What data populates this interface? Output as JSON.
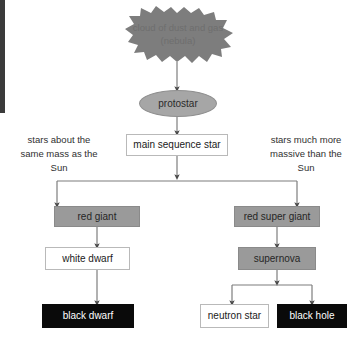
{
  "diagram": {
    "nodes": {
      "nebula": {
        "label": "cloud of dust and gas (nebula)",
        "shape": "cloud",
        "fill": "#7d7d7d"
      },
      "protostar": {
        "label": "protostar",
        "shape": "ellipse",
        "fill": "#a6a6a6"
      },
      "main_sequence": {
        "label": "main sequence star",
        "shape": "box",
        "fill": "#ffffff"
      },
      "red_giant": {
        "label": "red giant",
        "shape": "box",
        "fill": "#9a9a9a"
      },
      "red_super_giant": {
        "label": "red super giant",
        "shape": "box",
        "fill": "#9a9a9a"
      },
      "white_dwarf": {
        "label": "white dwarf",
        "shape": "box",
        "fill": "#ffffff"
      },
      "supernova": {
        "label": "supernova",
        "shape": "box",
        "fill": "#9a9a9a"
      },
      "black_dwarf": {
        "label": "black dwarf",
        "shape": "box",
        "fill": "#0a0a0a"
      },
      "neutron_star": {
        "label": "neutron star",
        "shape": "box",
        "fill": "#ffffff"
      },
      "black_hole": {
        "label": "black hole",
        "shape": "box",
        "fill": "#0a0a0a"
      }
    },
    "annotations": {
      "left_branch": "stars about the same mass as the Sun",
      "right_branch": "stars much more massive than the Sun"
    },
    "colors": {
      "arrow": "#6d6d6d",
      "box_border": "#b9b9b9",
      "gray_fill": "#9a9a9a",
      "black_fill": "#0a0a0a",
      "edge_bar": "#3b3b3b",
      "background": "#ffffff"
    }
  }
}
